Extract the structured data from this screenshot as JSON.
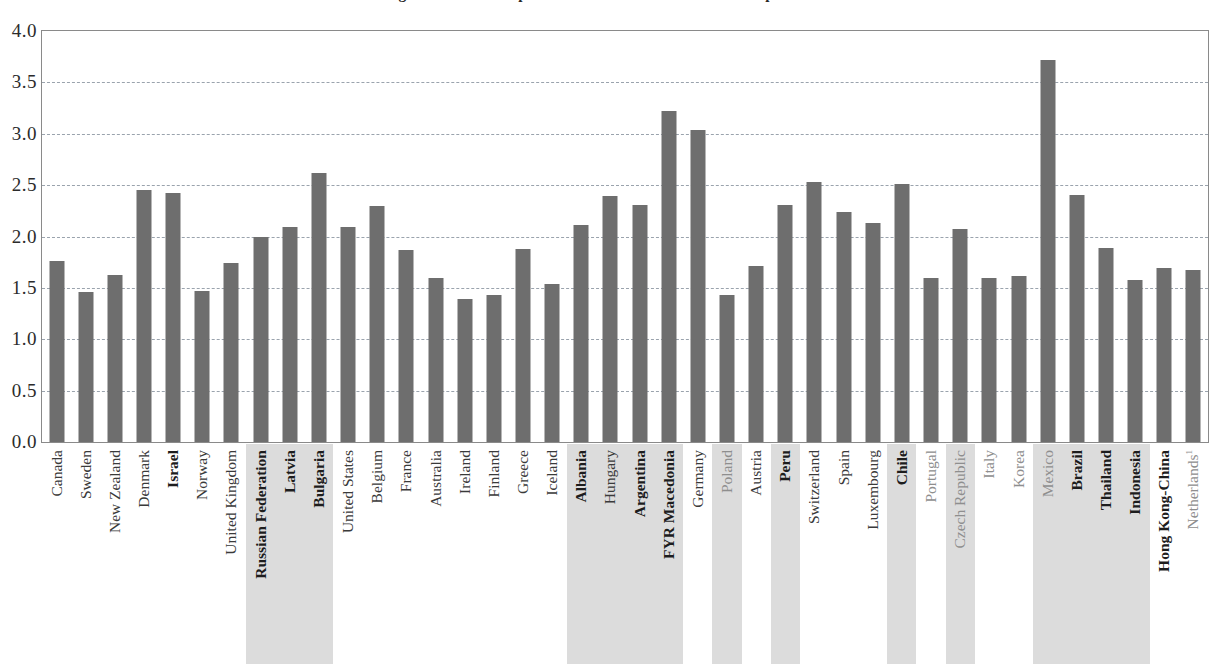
{
  "figure": {
    "title_clipped": "Figure A: Annual expenditure on educational institutions per student"
  },
  "chart_data": {
    "type": "bar",
    "title": "",
    "xlabel": "",
    "ylabel": "",
    "ylim": [
      0.0,
      4.0
    ],
    "ytick_labels": [
      "0.0",
      "0.5",
      "1.0",
      "1.5",
      "2.0",
      "2.5",
      "3.0",
      "3.5",
      "4.0"
    ],
    "ytick_values": [
      0.0,
      0.5,
      1.0,
      1.5,
      2.0,
      2.5,
      3.0,
      3.5,
      4.0
    ],
    "grid": true,
    "legend": "none",
    "bar_color": "#6e6e6e",
    "highlight_color": "#dcdcdc",
    "categories": [
      "Canada",
      "Sweden",
      "New Zealand",
      "Denmark",
      "Israel",
      "Norway",
      "United Kingdom",
      "Russian Federation",
      "Latvia",
      "Bulgaria",
      "United States",
      "Belgium",
      "France",
      "Australia",
      "Ireland",
      "Finland",
      "Greece",
      "Iceland",
      "Albania",
      "Hungary",
      "Argentina",
      "FYR Macedonia",
      "Germany",
      "Poland",
      "Austria",
      "Peru",
      "Switzerland",
      "Spain",
      "Luxembourg",
      "Chile",
      "Portugal",
      "Czech Republic",
      "Italy",
      "Korea",
      "Mexico",
      "Brazil",
      "Thailand",
      "Indonesia",
      "Hong Kong-China",
      "Netherlands"
    ],
    "values": [
      1.76,
      1.46,
      1.63,
      2.45,
      2.42,
      1.47,
      1.74,
      2.0,
      2.09,
      2.62,
      2.09,
      2.3,
      1.87,
      1.6,
      1.39,
      1.43,
      1.88,
      1.54,
      2.11,
      2.39,
      2.31,
      3.22,
      3.04,
      1.43,
      1.71,
      2.31,
      2.53,
      2.24,
      2.13,
      2.51,
      1.6,
      2.07,
      1.6,
      1.62,
      3.72,
      2.4,
      1.89,
      1.58,
      1.69,
      1.67
    ],
    "label_styles": [
      {
        "label": "Canada",
        "bold": false,
        "highlight": false,
        "muted": false
      },
      {
        "label": "Sweden",
        "bold": false,
        "highlight": false,
        "muted": false
      },
      {
        "label": "New Zealand",
        "bold": false,
        "highlight": false,
        "muted": false
      },
      {
        "label": "Denmark",
        "bold": false,
        "highlight": false,
        "muted": false
      },
      {
        "label": "Israel",
        "bold": true,
        "highlight": false,
        "muted": false
      },
      {
        "label": "Norway",
        "bold": false,
        "highlight": false,
        "muted": false
      },
      {
        "label": "United Kingdom",
        "bold": false,
        "highlight": false,
        "muted": false
      },
      {
        "label": "Russian Federation",
        "bold": true,
        "highlight": true,
        "muted": false
      },
      {
        "label": "Latvia",
        "bold": true,
        "highlight": true,
        "muted": false
      },
      {
        "label": "Bulgaria",
        "bold": true,
        "highlight": true,
        "muted": false
      },
      {
        "label": "United States",
        "bold": false,
        "highlight": false,
        "muted": false
      },
      {
        "label": "Belgium",
        "bold": false,
        "highlight": false,
        "muted": false
      },
      {
        "label": "France",
        "bold": false,
        "highlight": false,
        "muted": false
      },
      {
        "label": "Australia",
        "bold": false,
        "highlight": false,
        "muted": false
      },
      {
        "label": "Ireland",
        "bold": false,
        "highlight": false,
        "muted": false
      },
      {
        "label": "Finland",
        "bold": false,
        "highlight": false,
        "muted": false
      },
      {
        "label": "Greece",
        "bold": false,
        "highlight": false,
        "muted": false
      },
      {
        "label": "Iceland",
        "bold": false,
        "highlight": false,
        "muted": false
      },
      {
        "label": "Albania",
        "bold": true,
        "highlight": true,
        "muted": false
      },
      {
        "label": "Hungary",
        "bold": false,
        "highlight": true,
        "muted": false
      },
      {
        "label": "Argentina",
        "bold": true,
        "highlight": true,
        "muted": false
      },
      {
        "label": "FYR Macedonia",
        "bold": true,
        "highlight": true,
        "muted": false
      },
      {
        "label": "Germany",
        "bold": false,
        "highlight": false,
        "muted": false
      },
      {
        "label": "Poland",
        "bold": false,
        "highlight": true,
        "muted": true
      },
      {
        "label": "Austria",
        "bold": false,
        "highlight": false,
        "muted": false
      },
      {
        "label": "Peru",
        "bold": true,
        "highlight": true,
        "muted": false
      },
      {
        "label": "Switzerland",
        "bold": false,
        "highlight": false,
        "muted": false
      },
      {
        "label": "Spain",
        "bold": false,
        "highlight": false,
        "muted": false
      },
      {
        "label": "Luxembourg",
        "bold": false,
        "highlight": false,
        "muted": false
      },
      {
        "label": "Chile",
        "bold": true,
        "highlight": true,
        "muted": false
      },
      {
        "label": "Portugal",
        "bold": false,
        "highlight": false,
        "muted": true
      },
      {
        "label": "Czech Republic",
        "bold": false,
        "highlight": true,
        "muted": true
      },
      {
        "label": "Italy",
        "bold": false,
        "highlight": false,
        "muted": true
      },
      {
        "label": "Korea",
        "bold": false,
        "highlight": false,
        "muted": true
      },
      {
        "label": "Mexico",
        "bold": false,
        "highlight": true,
        "muted": true
      },
      {
        "label": "Brazil",
        "bold": true,
        "highlight": true,
        "muted": false
      },
      {
        "label": "Thailand",
        "bold": true,
        "highlight": true,
        "muted": false
      },
      {
        "label": "Indonesia",
        "bold": true,
        "highlight": true,
        "muted": false
      },
      {
        "label": "Hong Kong-China",
        "bold": true,
        "highlight": false,
        "muted": false
      },
      {
        "label": "Netherlands",
        "bold": false,
        "highlight": false,
        "muted": true,
        "superscript": "1"
      }
    ]
  }
}
